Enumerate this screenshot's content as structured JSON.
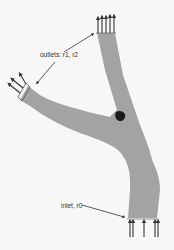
{
  "diagram": {
    "labels": {
      "outlets": "outlets: r1, r2",
      "inlet": "inlet, r0"
    },
    "colors": {
      "background": "#f7f7f7",
      "vessel": "#a3a3a3",
      "junction_mark": "#1a1a1a",
      "arrows": "#333333",
      "text": "#333333"
    },
    "boundaries": [
      {
        "name": "outlet-r1",
        "role": "outlet",
        "flow_arrows": 5
      },
      {
        "name": "outlet-r2",
        "role": "outlet",
        "flow_arrows": 3
      },
      {
        "name": "inlet-r0",
        "role": "inlet",
        "flow_arrows": 4
      }
    ]
  }
}
